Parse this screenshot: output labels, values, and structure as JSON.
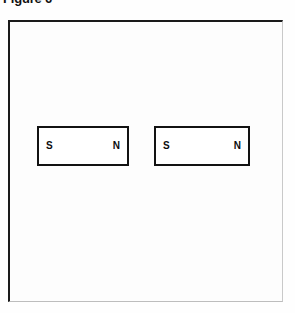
{
  "figure": {
    "title": "Figure 6",
    "frame": {
      "border_color": "#1a1a1a",
      "background_color": "#ffffff"
    },
    "magnets": [
      {
        "id": "left-magnet",
        "left_pole_label": "S",
        "right_pole_label": "N",
        "border_color": "#121212",
        "fill_color": "#ffffff"
      },
      {
        "id": "right-magnet",
        "left_pole_label": "S",
        "right_pole_label": "N",
        "border_color": "#121212",
        "fill_color": "#ffffff"
      }
    ]
  }
}
